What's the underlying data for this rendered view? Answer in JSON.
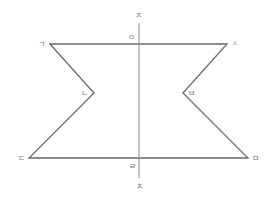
{
  "figure": {
    "type": "polygon-with-symmetry-axis",
    "colors": {
      "edge": "#6a6a6a",
      "axis": "#8a8a8a",
      "label": "#7a7a7a"
    },
    "vertices": {
      "g": {
        "label": "ㄱ",
        "x": 50,
        "y": 44
      },
      "n": {
        "label": "ㄴ",
        "x": 94,
        "y": 93
      },
      "d": {
        "label": "ㄷ",
        "x": 29,
        "y": 158
      },
      "m": {
        "label": "ㅁ",
        "x": 248,
        "y": 158
      },
      "b": {
        "label": "ㅂ",
        "x": 183,
        "y": 93
      },
      "s": {
        "label": "ㅅ",
        "x": 227,
        "y": 44
      }
    },
    "polygon_order": [
      "ㄱ",
      "ㄴ",
      "ㄷ",
      "ㅁ",
      "ㅂ",
      "ㅅ"
    ],
    "axis": {
      "top_label": "ㅈ",
      "bottom_label": "ㅊ",
      "top_intersection_label": "ㅇ",
      "bottom_intersection_label": "ㄹ",
      "x": 139,
      "y_start": 23,
      "y_end": 178
    }
  }
}
